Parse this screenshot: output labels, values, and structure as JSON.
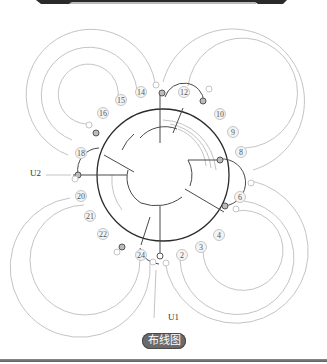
{
  "diagram": {
    "title_badge": "布线图",
    "labels": {
      "u1": "U1",
      "u2": "U2"
    },
    "slot_numbers": [
      {
        "id": "2",
        "x": 182,
        "y": 255
      },
      {
        "id": "3",
        "x": 201,
        "y": 247
      },
      {
        "id": "4",
        "x": 219,
        "y": 235
      },
      {
        "id": "6",
        "x": 240,
        "y": 197
      },
      {
        "id": "8",
        "x": 241,
        "y": 152
      },
      {
        "id": "9",
        "x": 233,
        "y": 132
      },
      {
        "id": "10",
        "x": 220,
        "y": 114
      },
      {
        "id": "12",
        "x": 184,
        "y": 92
      },
      {
        "id": "14",
        "x": 141,
        "y": 92
      },
      {
        "id": "15",
        "x": 121,
        "y": 100
      },
      {
        "id": "16",
        "x": 103,
        "y": 113
      },
      {
        "id": "18",
        "x": 81,
        "y": 153
      },
      {
        "id": "20",
        "x": 81,
        "y": 196
      },
      {
        "id": "21",
        "x": 90,
        "y": 216
      },
      {
        "id": "22",
        "x": 103,
        "y": 234
      },
      {
        "id": "24",
        "x": 141,
        "y": 255
      }
    ],
    "colors": {
      "outer_ring": "#2b2b2b",
      "winding_dark": "#444444",
      "winding_light": "#bdbdbd",
      "badge_bg": "#6b6b6b",
      "badge_text": "#ffffff"
    }
  }
}
